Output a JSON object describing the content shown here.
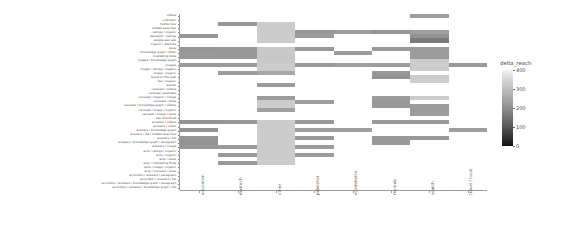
{
  "chart_data": {
    "type": "heatmap",
    "title": "",
    "xlabel": "",
    "ylabel": "",
    "legend": {
      "title": "delta_reach",
      "ticks": [
        400,
        300,
        200,
        100,
        0
      ],
      "vmin": 0,
      "vmax": 400,
      "colormap": "grey (light = high, dark = low)",
      "position": "right"
    },
    "grid": false,
    "x_categories": [
      "education",
      "martech",
      "other",
      "publisher",
      "ecommerce",
      "reviews",
      "search",
      "travel / local"
    ],
    "y_categories": [
      "videos",
      "unknown",
      "twitter box",
      "related searches",
      "ratings / organic",
      "places(0) / ratings",
      "people also ask",
      "organic / sitelinks",
      "news",
      "knowledge graph / other",
      "marketing tools",
      "images / knowledge graph",
      "images",
      "image / ratings / organic",
      "image / organic",
      "found on the web",
      "faq / organic",
      "events",
      "carousel / videos",
      "carousel / podcasts",
      "carousel / organic / image",
      "carousel / news",
      "carousel / knowledge graph / videos",
      "carousel / image / organic",
      "carousel / image / news",
      "app download",
      "answers / videos",
      "answers / video",
      "answers / knowledge graph",
      "answers / list / related searches",
      "answers / list",
      "answers / knowledge graph / paragraph",
      "answers / image",
      "amp / ratings / organic",
      "amp / organic",
      "amp / news",
      "amp / interesting finds",
      "amp / image / organic",
      "amp / carousel / news",
      "accordion / answers / paragraph",
      "accordion / answers / list",
      "accordion / answers / knowledge graph / paragraph",
      "accordion / answers / knowledge graph / list"
    ],
    "values": [
      [
        null,
        null,
        null,
        null,
        null,
        null,
        250,
        null
      ],
      [
        null,
        null,
        null,
        null,
        null,
        null,
        null,
        null
      ],
      [
        null,
        240,
        330,
        null,
        null,
        null,
        null,
        null
      ],
      [
        null,
        null,
        330,
        null,
        null,
        null,
        null,
        null
      ],
      [
        null,
        null,
        330,
        240,
        245,
        235,
        250,
        null
      ],
      [
        235,
        null,
        330,
        245,
        null,
        null,
        230,
        null
      ],
      [
        null,
        null,
        330,
        null,
        null,
        null,
        185,
        null
      ],
      [
        null,
        null,
        null,
        null,
        null,
        null,
        null,
        null
      ],
      [
        235,
        240,
        325,
        240,
        null,
        240,
        245,
        null
      ],
      [
        240,
        240,
        325,
        null,
        245,
        null,
        245,
        null
      ],
      [
        240,
        240,
        320,
        null,
        null,
        null,
        245,
        null
      ],
      [
        null,
        null,
        325,
        null,
        null,
        null,
        330,
        null
      ],
      [
        240,
        240,
        330,
        240,
        250,
        245,
        330,
        240
      ],
      [
        null,
        null,
        330,
        null,
        null,
        null,
        330,
        null
      ],
      [
        null,
        245,
        265,
        null,
        null,
        235,
        null,
        null
      ],
      [
        null,
        null,
        null,
        null,
        null,
        225,
        330,
        null
      ],
      [
        null,
        null,
        null,
        null,
        null,
        null,
        330,
        null
      ],
      [
        null,
        null,
        245,
        null,
        null,
        null,
        null,
        null
      ],
      [
        null,
        null,
        null,
        null,
        null,
        null,
        null,
        null
      ],
      [
        null,
        null,
        null,
        null,
        null,
        null,
        null,
        null
      ],
      [
        null,
        null,
        245,
        null,
        null,
        245,
        330,
        null
      ],
      [
        null,
        null,
        330,
        245,
        null,
        240,
        null,
        null
      ],
      [
        null,
        null,
        330,
        null,
        null,
        240,
        245,
        null
      ],
      [
        null,
        null,
        250,
        null,
        null,
        null,
        245,
        null
      ],
      [
        null,
        null,
        null,
        null,
        null,
        null,
        245,
        null
      ],
      [
        null,
        null,
        null,
        null,
        null,
        null,
        null,
        null
      ],
      [
        230,
        235,
        330,
        240,
        null,
        240,
        240,
        null
      ],
      [
        null,
        null,
        330,
        null,
        null,
        null,
        null,
        null
      ],
      [
        230,
        null,
        330,
        245,
        250,
        null,
        null,
        245
      ],
      [
        null,
        null,
        330,
        null,
        null,
        null,
        null,
        null
      ],
      [
        235,
        null,
        330,
        240,
        null,
        240,
        240,
        null
      ],
      [
        230,
        null,
        330,
        null,
        null,
        240,
        null,
        null
      ],
      [
        235,
        240,
        330,
        245,
        null,
        null,
        null,
        null
      ],
      [
        null,
        null,
        330,
        null,
        null,
        null,
        null,
        null
      ],
      [
        null,
        240,
        330,
        245,
        null,
        null,
        null,
        null
      ],
      [
        null,
        null,
        330,
        null,
        null,
        null,
        null,
        null
      ],
      [
        null,
        240,
        330,
        null,
        null,
        null,
        null,
        null
      ],
      [
        null,
        null,
        null,
        null,
        null,
        null,
        null,
        null
      ],
      [
        null,
        null,
        null,
        null,
        null,
        null,
        null,
        null
      ],
      [
        null,
        null,
        null,
        null,
        null,
        null,
        null,
        null
      ],
      [
        null,
        null,
        null,
        null,
        null,
        null,
        null,
        null
      ],
      [
        null,
        null,
        null,
        null,
        null,
        null,
        null,
        null
      ],
      [
        null,
        null,
        null,
        null,
        null,
        null,
        null,
        null
      ]
    ]
  },
  "axes": {
    "y_tick_labels": [
      "videos",
      "unknown",
      "twitter box",
      "related searches",
      "ratings / organic",
      "places(0) / ratings",
      "people also ask",
      "organic / sitelinks",
      "news",
      "knowledge graph / other",
      "marketing tools",
      "images / knowledge graph",
      "images",
      "image / ratings / organic",
      "image / organic",
      "found on the web",
      "faq / organic",
      "events",
      "carousel / videos",
      "carousel / podcasts",
      "carousel / organic / image",
      "carousel / news",
      "carousel / knowledge graph / videos",
      "carousel / image / organic",
      "carousel / image / news",
      "app download",
      "answers / videos",
      "answers / video",
      "answers / knowledge graph",
      "answers / list / related searches",
      "answers / list",
      "answers / knowledge graph / paragraph",
      "answers / image",
      "amp / ratings / organic",
      "amp / organic",
      "amp / news",
      "amp / interesting finds",
      "amp / image / organic",
      "amp / carousel / news",
      "accordion / answers / paragraph",
      "accordion / answers / list",
      "accordion / answers / knowledge graph / paragraph",
      "accordion / answers / knowledge graph / list"
    ],
    "x_tick_labels": [
      "education",
      "martech",
      "other",
      "publisher",
      "ecommerce",
      "reviews",
      "search",
      "travel / local"
    ]
  },
  "colorbar": {
    "title": "delta_reach",
    "tick_labels": [
      "400",
      "300",
      "200",
      "100",
      "0"
    ]
  }
}
